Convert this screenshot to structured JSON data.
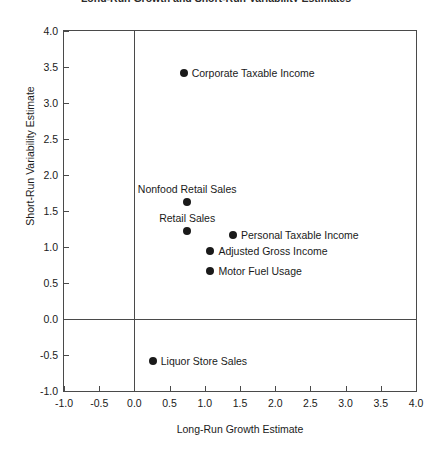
{
  "chart_data": {
    "type": "scatter",
    "title": "Long-Run Growth and Short-Run Variability Estimates",
    "xlabel": "Long-Run Growth Estimate",
    "ylabel": "Short-Run Variability Estimate",
    "xlim": [
      -1.0,
      4.0
    ],
    "ylim": [
      -1.0,
      4.0
    ],
    "xticks": [
      "-1.0",
      "-0.5",
      "0.0",
      "0.5",
      "1.0",
      "1.5",
      "2.0",
      "2.5",
      "3.0",
      "3.5",
      "4.0"
    ],
    "yticks": [
      "-1.0",
      "-0.5",
      "0.0",
      "0.5",
      "1.0",
      "1.5",
      "2.0",
      "2.5",
      "3.0",
      "3.5",
      "4.0"
    ],
    "xtick_values": [
      -1.0,
      -0.5,
      0.0,
      0.5,
      1.0,
      1.5,
      2.0,
      2.5,
      3.0,
      3.5,
      4.0
    ],
    "ytick_values": [
      -1.0,
      -0.5,
      0.0,
      0.5,
      1.0,
      1.5,
      2.0,
      2.5,
      3.0,
      3.5,
      4.0
    ],
    "grid": false,
    "legend": "none",
    "reference_lines": {
      "x": 0.0,
      "y": 0.0
    },
    "marker": {
      "shape": "circle",
      "color": "#1a1a1a",
      "size_px": 8
    },
    "points": [
      {
        "label": "Corporate Taxable Income",
        "x": 0.7,
        "y": 3.41,
        "label_pos": "right"
      },
      {
        "label": "Nonfood Retail Sales",
        "x": 0.75,
        "y": 1.62,
        "label_pos": "above"
      },
      {
        "label": "Retail Sales",
        "x": 0.75,
        "y": 1.22,
        "label_pos": "above"
      },
      {
        "label": "Personal Taxable Income",
        "x": 1.4,
        "y": 1.17,
        "label_pos": "right"
      },
      {
        "label": "Adjusted Gross Income",
        "x": 1.08,
        "y": 0.94,
        "label_pos": "right"
      },
      {
        "label": "Motor Fuel Usage",
        "x": 1.08,
        "y": 0.66,
        "label_pos": "right"
      },
      {
        "label": "Liquor Store Sales",
        "x": 0.26,
        "y": -0.59,
        "label_pos": "right"
      }
    ]
  },
  "colors": {
    "axis": "#4a4a4a",
    "text": "#1a1a1a",
    "marker": "#1a1a1a",
    "background": "#ffffff"
  }
}
